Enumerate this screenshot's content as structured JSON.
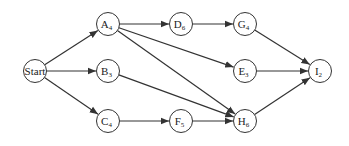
{
  "diagram": {
    "type": "activity-network",
    "colors": {
      "stroke": "#333333",
      "text": "#222222",
      "background": "#ffffff"
    },
    "nodes": [
      {
        "id": "Start",
        "letter": "Start",
        "sub": "",
        "x": 35,
        "y": 71
      },
      {
        "id": "A",
        "letter": "A",
        "sub": "4",
        "x": 108,
        "y": 24
      },
      {
        "id": "B",
        "letter": "B",
        "sub": "3",
        "x": 108,
        "y": 71
      },
      {
        "id": "C",
        "letter": "C",
        "sub": "4",
        "x": 108,
        "y": 121
      },
      {
        "id": "D",
        "letter": "D",
        "sub": "6",
        "x": 181,
        "y": 24
      },
      {
        "id": "E",
        "letter": "E",
        "sub": "3",
        "x": 245,
        "y": 71
      },
      {
        "id": "F",
        "letter": "F",
        "sub": "5",
        "x": 181,
        "y": 121
      },
      {
        "id": "G",
        "letter": "G",
        "sub": "4",
        "x": 245,
        "y": 24
      },
      {
        "id": "H",
        "letter": "H",
        "sub": "6",
        "x": 245,
        "y": 121
      },
      {
        "id": "I",
        "letter": "I",
        "sub": "2",
        "x": 320,
        "y": 71
      }
    ],
    "edges": [
      [
        "Start",
        "A"
      ],
      [
        "Start",
        "B"
      ],
      [
        "Start",
        "C"
      ],
      [
        "A",
        "D"
      ],
      [
        "A",
        "E"
      ],
      [
        "A",
        "H"
      ],
      [
        "B",
        "H"
      ],
      [
        "C",
        "F"
      ],
      [
        "F",
        "H"
      ],
      [
        "D",
        "G"
      ],
      [
        "G",
        "I"
      ],
      [
        "E",
        "I"
      ],
      [
        "H",
        "I"
      ]
    ]
  }
}
